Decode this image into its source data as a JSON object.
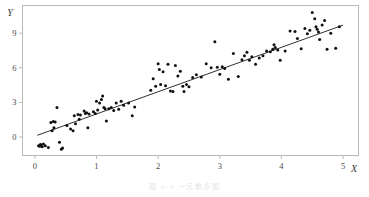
{
  "figure": {
    "caption": "图 4-3  一元散点图"
  },
  "chart_data": {
    "type": "scatter",
    "title": "",
    "xlabel": "X",
    "ylabel": "Y",
    "xlim": [
      -0.2,
      5.25
    ],
    "ylim": [
      -1.6,
      11.4
    ],
    "xticks": [
      0,
      1,
      2,
      3,
      4,
      5
    ],
    "yticks": [
      0,
      3,
      6,
      9
    ],
    "xtick_labels": [
      "0",
      "1",
      "2",
      "3",
      "4",
      "5"
    ],
    "ytick_labels": [
      "0",
      "3",
      "6",
      "9"
    ],
    "grid": false,
    "legend": null,
    "point_color": "#101010",
    "line_color": "#1a1a1a",
    "frame_color": "#b9b9b9",
    "marker_radius": 1.5,
    "series": [
      {
        "name": "observations",
        "kind": "scatter",
        "x": [
          0.06,
          0.08,
          0.09,
          0.1,
          0.12,
          0.14,
          0.17,
          0.22,
          0.26,
          0.28,
          0.3,
          0.31,
          0.33,
          0.36,
          0.4,
          0.43,
          0.45,
          0.52,
          0.58,
          0.62,
          0.64,
          0.66,
          0.7,
          0.72,
          0.74,
          0.8,
          0.82,
          0.84,
          0.86,
          0.88,
          0.95,
          0.98,
          1.0,
          1.02,
          1.05,
          1.08,
          1.1,
          1.12,
          1.14,
          1.16,
          1.2,
          1.24,
          1.28,
          1.32,
          1.36,
          1.4,
          1.44,
          1.52,
          1.58,
          1.62,
          1.88,
          1.92,
          1.96,
          2.0,
          2.02,
          2.04,
          2.08,
          2.12,
          2.16,
          2.2,
          2.24,
          2.28,
          2.32,
          2.36,
          2.4,
          2.42,
          2.46,
          2.5,
          2.56,
          2.62,
          2.7,
          2.78,
          2.86,
          2.92,
          2.96,
          3.0,
          3.04,
          3.08,
          3.14,
          3.22,
          3.3,
          3.36,
          3.4,
          3.44,
          3.48,
          3.52,
          3.58,
          3.64,
          3.7,
          3.76,
          3.82,
          3.86,
          3.88,
          3.9,
          3.94,
          3.98,
          4.06,
          4.14,
          4.22,
          4.26,
          4.32,
          4.38,
          4.42,
          4.46,
          4.5,
          4.54,
          4.56,
          4.58,
          4.6,
          4.62,
          4.66,
          4.7,
          4.74,
          4.8,
          4.88,
          4.94
        ],
        "y": [
          -0.75,
          -0.8,
          -0.65,
          -0.7,
          -0.85,
          -0.6,
          -0.75,
          -0.9,
          1.25,
          0.55,
          1.35,
          0.8,
          1.3,
          2.55,
          -0.45,
          -1.05,
          -0.95,
          1.0,
          0.7,
          0.55,
          1.85,
          1.15,
          1.95,
          1.55,
          1.9,
          2.25,
          2.05,
          2.1,
          0.8,
          2.0,
          2.2,
          2.05,
          3.1,
          2.35,
          2.95,
          3.25,
          3.55,
          2.55,
          2.45,
          1.4,
          2.45,
          2.55,
          2.3,
          2.95,
          2.4,
          3.1,
          2.75,
          2.95,
          1.85,
          2.6,
          4.05,
          5.05,
          4.4,
          6.35,
          5.85,
          4.55,
          5.65,
          4.45,
          6.3,
          4.0,
          3.95,
          6.2,
          5.3,
          5.7,
          4.4,
          3.95,
          4.55,
          4.35,
          5.15,
          5.4,
          5.2,
          6.35,
          6.0,
          8.25,
          6.05,
          5.45,
          6.1,
          5.95,
          5.0,
          7.25,
          5.25,
          6.7,
          7.05,
          7.35,
          6.65,
          6.95,
          6.3,
          6.85,
          7.05,
          7.45,
          7.4,
          7.6,
          8.0,
          7.75,
          7.55,
          6.65,
          7.45,
          9.2,
          9.15,
          8.55,
          7.65,
          9.4,
          8.95,
          9.25,
          10.8,
          10.25,
          9.55,
          9.35,
          9.1,
          8.45,
          9.7,
          10.1,
          7.6,
          9.0,
          7.7,
          9.55
        ]
      },
      {
        "name": "regression-line",
        "kind": "line",
        "x": [
          0.04,
          5.0
        ],
        "y": [
          0.15,
          9.7
        ],
        "slope": 1.93,
        "intercept": 0.07
      }
    ]
  }
}
